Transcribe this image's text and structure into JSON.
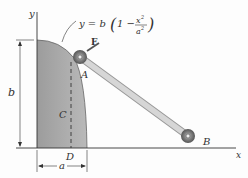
{
  "diagram": {
    "equation": {
      "prefix": "y = b",
      "numerator": "x",
      "exp": "2",
      "denominator": "a",
      "one": "1 −"
    },
    "labels": {
      "y_axis": "y",
      "x_axis": "x",
      "height": "b",
      "width": "a",
      "point_A": "A",
      "point_B": "B",
      "point_C": "C",
      "point_D": "D",
      "force": "F"
    },
    "colors": {
      "region": "#a9a9a9",
      "rod": "#c8c8c8",
      "roller": "#777777",
      "lines": "#333333"
    }
  }
}
